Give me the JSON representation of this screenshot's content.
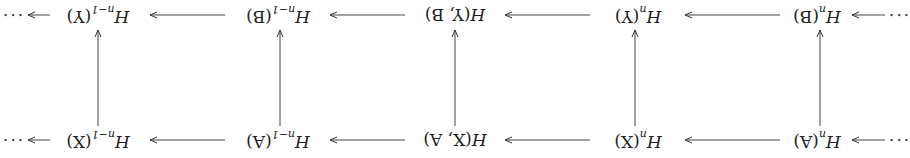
{
  "diagram": {
    "type": "commutative-diagram",
    "orientation": "rotated 180 degrees",
    "ellipsis": "···",
    "top_row": [
      {
        "id": "HnB",
        "base": "H",
        "sub": "n",
        "arg": "(B)"
      },
      {
        "id": "HnY",
        "base": "H",
        "sub": "n",
        "arg": "(Y)"
      },
      {
        "id": "HYB",
        "base": "H",
        "sub": "",
        "arg": "(Y, B)"
      },
      {
        "id": "Hn1B",
        "base": "H",
        "sub": "n−1",
        "arg": "(B)"
      },
      {
        "id": "Hn1Y",
        "base": "H",
        "sub": "n−1",
        "arg": "(Y)"
      }
    ],
    "bottom_row": [
      {
        "id": "HnA",
        "base": "H",
        "sub": "n",
        "arg": "(A)"
      },
      {
        "id": "HnX",
        "base": "H",
        "sub": "n",
        "arg": "(X)"
      },
      {
        "id": "HXA",
        "base": "H",
        "sub": "",
        "arg": "(X, A)"
      },
      {
        "id": "Hn1A",
        "base": "H",
        "sub": "n−1",
        "arg": "(A)"
      },
      {
        "id": "Hn1X",
        "base": "H",
        "sub": "n−1",
        "arg": "(X)"
      }
    ],
    "vertical_maps": [
      {
        "from": "HnA",
        "to": "HnB"
      },
      {
        "from": "HnX",
        "to": "HnY"
      },
      {
        "from": "HXA",
        "to": "HYB"
      },
      {
        "from": "Hn1A",
        "to": "Hn1B"
      },
      {
        "from": "Hn1X",
        "to": "Hn1Y"
      }
    ]
  }
}
